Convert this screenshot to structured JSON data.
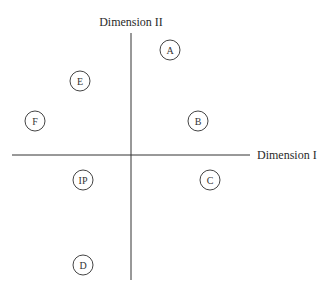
{
  "diagram": {
    "type": "perceptual-map",
    "y_axis_label": "Dimension II",
    "x_axis_label": "Dimension I",
    "points": [
      {
        "label": "A",
        "x": 170,
        "y": 50
      },
      {
        "label": "E",
        "x": 80,
        "y": 81
      },
      {
        "label": "F",
        "x": 35,
        "y": 121
      },
      {
        "label": "B",
        "x": 198,
        "y": 121
      },
      {
        "label": "IP",
        "x": 83,
        "y": 180
      },
      {
        "label": "C",
        "x": 210,
        "y": 180
      },
      {
        "label": "D",
        "x": 83,
        "y": 265
      }
    ]
  }
}
